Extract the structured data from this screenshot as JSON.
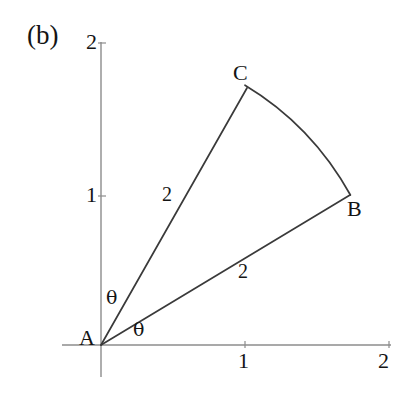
{
  "figure": {
    "panel_label": "(b)",
    "background_color": "#ffffff",
    "axis_color": "#8c8c8c",
    "line_color": "#3a3a3a",
    "text_color": "#141414",
    "origin_px": {
      "x": 101,
      "y": 345
    },
    "unit_px": {
      "x": 144,
      "y": 150
    },
    "axes": {
      "x_axis": {
        "start_px": {
          "x": 62,
          "y": 345
        },
        "end_px": {
          "x": 391,
          "y": 345
        },
        "ticks": [
          {
            "label": "1",
            "value": 1,
            "px_x": 245,
            "label_px": {
              "x": 239,
              "y": 352
            }
          },
          {
            "label": "2",
            "value": 2,
            "px_x": 389,
            "label_px": {
              "x": 377,
              "y": 352
            }
          }
        ]
      },
      "y_axis": {
        "start_px": {
          "x": 101,
          "y": 42
        },
        "end_px": {
          "x": 101,
          "y": 377
        },
        "ticks": [
          {
            "label": "1",
            "value": 1,
            "px_y": 196,
            "label_px": {
              "x": 86,
              "y": 186
            }
          },
          {
            "label": "2",
            "value": 2,
            "px_y": 43,
            "label_px": {
              "x": 86,
              "y": 33
            }
          }
        ]
      }
    },
    "vertices": [
      {
        "name": "A",
        "label": "A",
        "coord": {
          "x": 0,
          "y": 0
        },
        "px": {
          "x": 101,
          "y": 345
        },
        "label_px": {
          "x": 80,
          "y": 329
        }
      },
      {
        "name": "B",
        "label": "B",
        "coord": {
          "x": 1.73,
          "y": 1.0
        },
        "px": {
          "x": 350,
          "y": 195
        },
        "label_px": {
          "x": 348,
          "y": 199
        }
      },
      {
        "name": "C",
        "label": "C",
        "coord": {
          "x": 1.0,
          "y": 1.73
        },
        "px": {
          "x": 247,
          "y": 88
        },
        "label_px": {
          "x": 234,
          "y": 64
        }
      }
    ],
    "segments": [
      {
        "name": "segment-AC",
        "from": "A",
        "to": "C",
        "length_label": "2",
        "label_px": {
          "x": 162,
          "y": 183
        }
      },
      {
        "name": "segment-AB",
        "from": "A",
        "to": "B",
        "length_label": "2",
        "label_px": {
          "x": 238,
          "y": 260
        }
      }
    ],
    "arc": {
      "name": "arc-CB",
      "from": "C",
      "to": "B",
      "center": "A",
      "radius": 2,
      "start_angle_deg": 60,
      "end_angle_deg": 30
    },
    "angles": [
      {
        "name": "angle-theta-upper",
        "label": "θ",
        "between": "y-axis and AC",
        "label_px": {
          "x": 106,
          "y": 288
        }
      },
      {
        "name": "angle-theta-lower",
        "label": "θ",
        "between": "AB and x-axis",
        "label_px": {
          "x": 133,
          "y": 321
        }
      }
    ]
  },
  "chart_data": {
    "type": "scatter",
    "title": "(b)",
    "xlabel": "",
    "ylabel": "",
    "xlim": [
      0,
      2
    ],
    "ylim": [
      0,
      2
    ],
    "xticks": [
      1,
      2
    ],
    "yticks": [
      1,
      2
    ],
    "grid": false,
    "legend": "none",
    "points": [
      {
        "label": "A",
        "x": 0,
        "y": 0
      },
      {
        "label": "B",
        "x": 1.73,
        "y": 1.0
      },
      {
        "label": "C",
        "x": 1.0,
        "y": 1.73
      }
    ],
    "annotations": [
      {
        "text": "2",
        "note": "length of segment A-C"
      },
      {
        "text": "2",
        "note": "length of segment A-B"
      },
      {
        "text": "θ",
        "note": "angle between positive y-axis and AC"
      },
      {
        "text": "θ",
        "note": "angle between AB and positive x-axis"
      }
    ]
  }
}
